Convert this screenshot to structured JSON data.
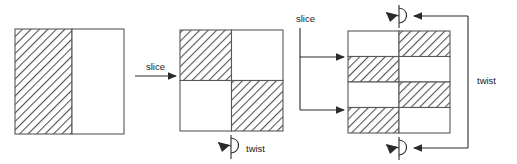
{
  "figure": {
    "stroke_color": "#585858",
    "hatch_color": "#555555",
    "fill_color": "#ffffff",
    "arrow_color": "#2b2b2b",
    "text_color": "#1a1a1a"
  },
  "labels": {
    "slice_1": "slice",
    "slice_2": "slice",
    "twist_1": "twist",
    "twist_2": "twist"
  },
  "stages": [
    {
      "name": "stage-1-halves",
      "x": 15,
      "y": 29,
      "w": 109,
      "h": 105,
      "cols": 2,
      "rows": 1,
      "col_fracs": [
        0.52,
        0.48
      ],
      "row_fracs": [
        1
      ],
      "cells": [
        {
          "row": 0,
          "col": 0,
          "fill": "hatched"
        },
        {
          "row": 0,
          "col": 1,
          "fill": "white"
        }
      ]
    },
    {
      "name": "stage-2-quarters",
      "x": 180,
      "y": 30,
      "w": 103,
      "h": 101,
      "cols": 2,
      "rows": 2,
      "col_fracs": [
        0.5,
        0.5
      ],
      "row_fracs": [
        0.5,
        0.5
      ],
      "cells": [
        {
          "row": 0,
          "col": 0,
          "fill": "hatched"
        },
        {
          "row": 0,
          "col": 1,
          "fill": "white"
        },
        {
          "row": 1,
          "col": 0,
          "fill": "white"
        },
        {
          "row": 1,
          "col": 1,
          "fill": "hatched"
        }
      ]
    },
    {
      "name": "stage-3-eighths",
      "x": 348,
      "y": 31,
      "w": 102,
      "h": 102,
      "cols": 2,
      "rows": 4,
      "col_fracs": [
        0.5,
        0.5
      ],
      "row_fracs": [
        0.25,
        0.25,
        0.25,
        0.25
      ],
      "cells": [
        {
          "row": 0,
          "col": 0,
          "fill": "white"
        },
        {
          "row": 0,
          "col": 1,
          "fill": "hatched"
        },
        {
          "row": 1,
          "col": 0,
          "fill": "hatched"
        },
        {
          "row": 1,
          "col": 1,
          "fill": "white"
        },
        {
          "row": 2,
          "col": 0,
          "fill": "white"
        },
        {
          "row": 2,
          "col": 1,
          "fill": "hatched"
        },
        {
          "row": 3,
          "col": 0,
          "fill": "hatched"
        },
        {
          "row": 3,
          "col": 1,
          "fill": "white"
        }
      ]
    }
  ],
  "annotations": {
    "slice_1_label_pos": {
      "x": 146,
      "y": 67
    },
    "slice_2_label_pos": {
      "x": 296,
      "y": 22
    },
    "twist_1_label_pos": {
      "x": 242,
      "y": 152
    },
    "twist_2_label_pos": {
      "x": 477,
      "y": 84
    },
    "twist_icons": [
      {
        "name": "twist-icon-bottom-center",
        "x": 225,
        "y": 145
      },
      {
        "name": "twist-icon-top-right",
        "x": 398,
        "y": 16
      },
      {
        "name": "twist-icon-bottom-right",
        "x": 398,
        "y": 148
      }
    ]
  }
}
